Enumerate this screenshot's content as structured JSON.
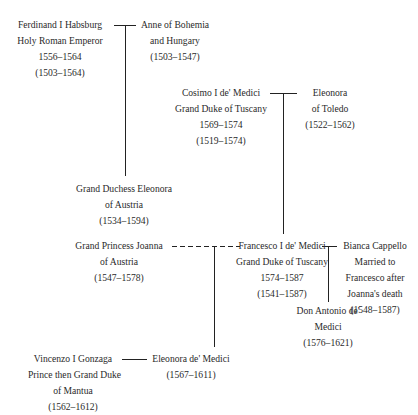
{
  "diagram": {
    "type": "family-tree",
    "people": [
      {
        "id": "ferdinand",
        "lines": [
          "Ferdinand I Habsburg",
          "Holy Roman Emperor",
          "1556–1564",
          "(1503–1564)"
        ]
      },
      {
        "id": "anne",
        "lines": [
          "Anne of Bohemia",
          "and Hungary",
          "(1503–1547)"
        ]
      },
      {
        "id": "cosimo",
        "lines": [
          "Cosimo I de' Medici",
          "Grand Duke of Tuscany",
          "1569–1574",
          "(1519–1574)"
        ]
      },
      {
        "id": "eleonora-toledo",
        "lines": [
          "Eleonora",
          "of Toledo",
          "(1522–1562)"
        ]
      },
      {
        "id": "eleonora-austria",
        "lines": [
          "Grand Duchess Eleonora",
          "of Austria",
          "(1534–1594)"
        ]
      },
      {
        "id": "joanna",
        "lines": [
          "Grand Princess Joanna",
          "of Austria",
          "(1547–1578)"
        ]
      },
      {
        "id": "francesco",
        "lines": [
          "Francesco I de' Medici",
          "Grand Duke of Tuscany",
          "1574–1587",
          "(1541–1587)"
        ]
      },
      {
        "id": "bianca",
        "lines": [
          "Bianca Cappello",
          "Married to",
          "Francesco after",
          "Joanna's death",
          "(1548–1587)"
        ]
      },
      {
        "id": "antonio",
        "lines": [
          "Don Antonio de'",
          "Medici",
          "(1576–1621)"
        ]
      },
      {
        "id": "vincenzo",
        "lines": [
          "Vincenzo I Gonzaga",
          "Prince then Grand Duke",
          "of Mantua",
          "(1562–1612)"
        ]
      },
      {
        "id": "eleonora-medici",
        "lines": [
          "Eleonora de' Medici",
          "(1567–1611)"
        ]
      }
    ],
    "relations": [
      {
        "type": "marriage",
        "from": "ferdinand",
        "to": "anne",
        "child": "eleonora-austria"
      },
      {
        "type": "marriage",
        "from": "cosimo",
        "to": "eleonora-toledo",
        "child": "francesco"
      },
      {
        "type": "marriage-dashed",
        "from": "joanna",
        "to": "francesco",
        "child": "eleonora-medici"
      },
      {
        "type": "marriage",
        "from": "francesco",
        "to": "bianca",
        "child": "antonio"
      },
      {
        "type": "marriage",
        "from": "vincenzo",
        "to": "eleonora-medici"
      }
    ]
  }
}
